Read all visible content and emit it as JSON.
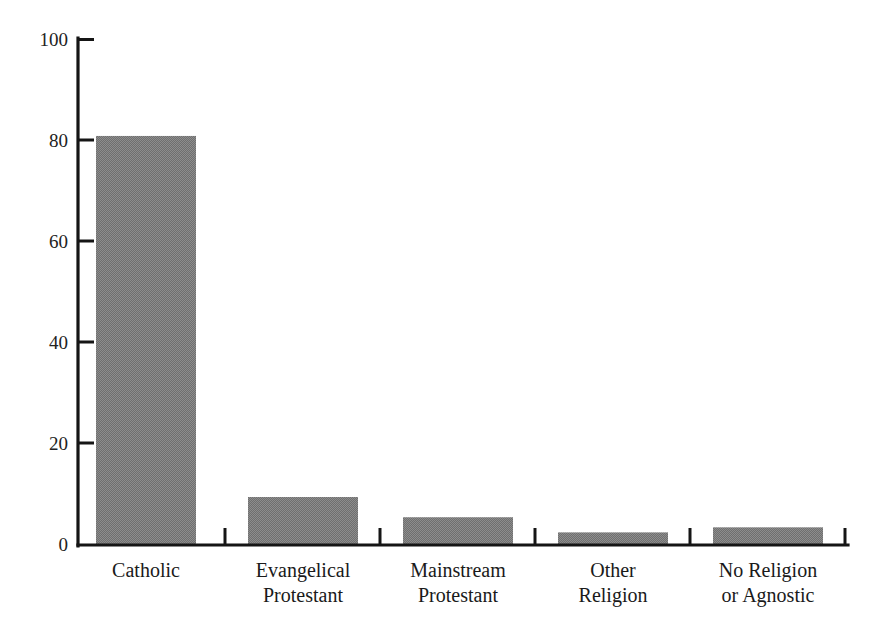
{
  "chart_data": {
    "type": "bar",
    "title": "",
    "subtitle": "",
    "xlabel": "",
    "ylabel": "",
    "ylim": [
      0,
      100
    ],
    "yticks": [
      0,
      20,
      40,
      60,
      80,
      100
    ],
    "grid": false,
    "legend": "none",
    "bar_fill_color": "#7b7b7b",
    "axis_color": "#151515",
    "background_color": "#ffffff",
    "categories": [
      "Catholic",
      "Evangelical Protestant",
      "Mainstream Protestant",
      "Other Religion",
      "No Religion or Agnostic"
    ],
    "category_lines": [
      [
        "Catholic"
      ],
      [
        "Evangelical",
        "Protestant"
      ],
      [
        "Mainstream",
        "Protestant"
      ],
      [
        "Other",
        "Religion"
      ],
      [
        "No Religion",
        "or Agnostic"
      ]
    ],
    "values": [
      81,
      9.5,
      5.5,
      2.5,
      3.5
    ]
  },
  "axis": {
    "y_tick_labels": [
      "100",
      "80",
      "60",
      "40",
      "20",
      "0"
    ]
  }
}
